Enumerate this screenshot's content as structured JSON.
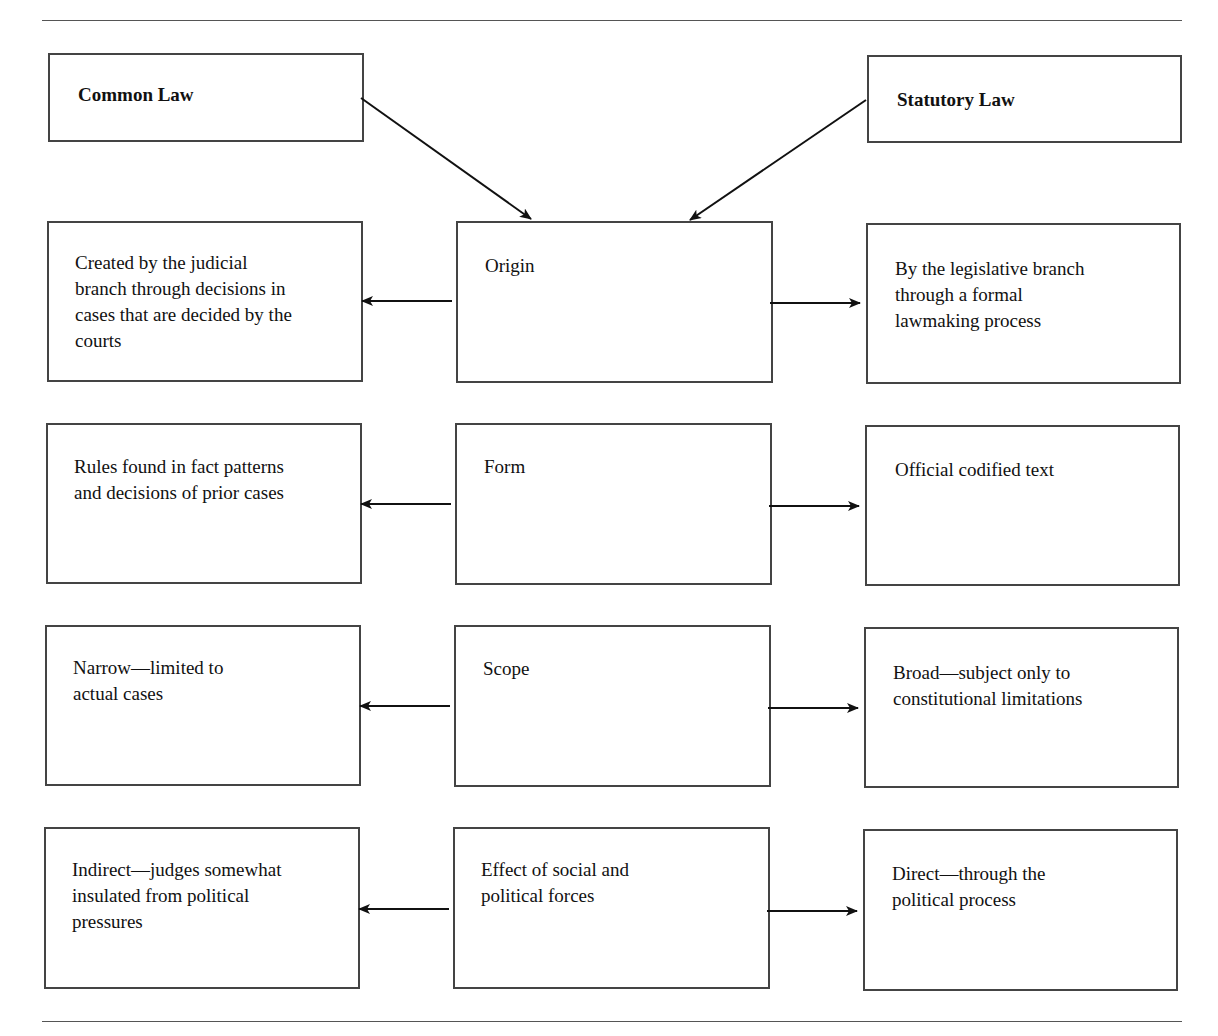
{
  "diagram": {
    "sources": {
      "left": {
        "label": "Common Law"
      },
      "right": {
        "label": "Statutory Law"
      }
    },
    "rows": [
      {
        "criterion": "Origin",
        "common_law": "Created by the judicial\nbranch through decisions in\ncases that are decided by the\ncourts",
        "statutory_law": "By the legislative branch\nthrough a formal\nlawmaking process"
      },
      {
        "criterion": "Form",
        "common_law": "Rules found in fact patterns\nand decisions of prior cases",
        "statutory_law": "Official codified text"
      },
      {
        "criterion": "Scope",
        "common_law": "Narrow—limited to\nactual cases",
        "statutory_law": "Broad—subject only to\nconstitutional limitations"
      },
      {
        "criterion": "Effect of social and\npolitical forces",
        "common_law": "Indirect—judges somewhat\ninsulated from political\npressures",
        "statutory_law": "Direct—through the\npolitical process"
      }
    ],
    "edges": [
      {
        "from": "Common Law",
        "to": "Origin"
      },
      {
        "from": "Statutory Law",
        "to": "Origin"
      },
      {
        "from": "Origin",
        "to": "Common Law: Origin"
      },
      {
        "from": "Origin",
        "to": "Statutory Law: Origin"
      },
      {
        "from": "Form",
        "to": "Common Law: Form"
      },
      {
        "from": "Form",
        "to": "Statutory Law: Form"
      },
      {
        "from": "Scope",
        "to": "Common Law: Scope"
      },
      {
        "from": "Scope",
        "to": "Statutory Law: Scope"
      },
      {
        "from": "Effect of social and political forces",
        "to": "Common Law: Effect"
      },
      {
        "from": "Effect of social and political forces",
        "to": "Statutory Law: Effect"
      }
    ]
  }
}
